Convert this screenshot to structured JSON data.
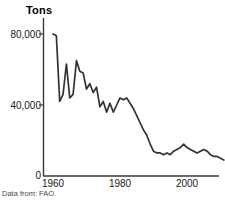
{
  "caption": "Data from: FAO.",
  "chart_data": {
    "type": "line",
    "title": "Tons",
    "xlabel": "",
    "ylabel": "Tons",
    "xlim": [
      1960,
      2011
    ],
    "ylim": [
      0,
      88000
    ],
    "grid": false,
    "legend": "none",
    "y_ticks": [
      0,
      40000,
      80000
    ],
    "y_tick_labels": [
      "0",
      "40,000",
      "80,000"
    ],
    "x_ticks": [
      1960,
      1980,
      2000
    ],
    "x_tick_labels": [
      "1960",
      "1980",
      "2000"
    ],
    "line_color": "#333333",
    "x": [
      1960,
      1961,
      1962,
      1963,
      1964,
      1965,
      1966,
      1967,
      1968,
      1969,
      1970,
      1971,
      1972,
      1973,
      1974,
      1975,
      1976,
      1977,
      1978,
      1979,
      1980,
      1981,
      1982,
      1983,
      1984,
      1985,
      1986,
      1987,
      1988,
      1989,
      1990,
      1991,
      1992,
      1993,
      1994,
      1995,
      1996,
      1997,
      1998,
      1999,
      2000,
      2001,
      2002,
      2003,
      2004,
      2005,
      2006,
      2007,
      2008,
      2009,
      2010,
      2011
    ],
    "values": [
      80000,
      79000,
      42000,
      46000,
      63000,
      44000,
      46000,
      65000,
      59000,
      58000,
      49000,
      52000,
      47000,
      50000,
      39000,
      42000,
      36000,
      41000,
      36000,
      40000,
      44000,
      43000,
      44000,
      41000,
      38000,
      34000,
      30000,
      26000,
      23000,
      18000,
      14000,
      13000,
      13000,
      12000,
      13000,
      12000,
      14000,
      15000,
      16000,
      18000,
      16000,
      15000,
      14000,
      13000,
      14000,
      15000,
      14000,
      12000,
      11000,
      11000,
      10000,
      9000
    ]
  }
}
